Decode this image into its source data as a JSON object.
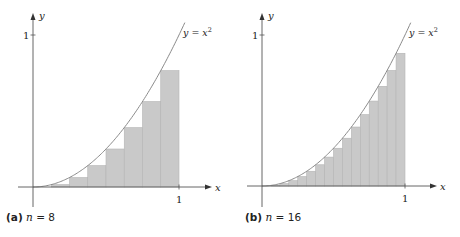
{
  "colors": {
    "fill": "#c9c9c9",
    "rect_edge": "#b4b4b4",
    "curve": "#8a8a8a",
    "axis": "#555555",
    "text": "#222222"
  },
  "panels": [
    {
      "id": "a",
      "caption_tag": "(a)",
      "caption_var": "n",
      "caption_eq": " = 8",
      "n": 8,
      "curve_label": "y = x",
      "curve_label_exp": "2",
      "x_axis_label": "x",
      "y_axis_label": "y",
      "x_tick_label": "1",
      "y_tick_label": "1",
      "geom": {
        "ox": 33,
        "oy": 187,
        "w": 146,
        "h": 152,
        "x_end": 212,
        "y_top": 13,
        "y_bottom": 207,
        "x_start": 18
      }
    },
    {
      "id": "b",
      "caption_tag": "(b)",
      "caption_var": "n",
      "caption_eq": " = 16",
      "n": 16,
      "curve_label": "y = x",
      "curve_label_exp": "2",
      "x_axis_label": "x",
      "y_axis_label": "y",
      "x_tick_label": "1",
      "y_tick_label": "1",
      "geom": {
        "ox": 262,
        "oy": 186,
        "w": 143,
        "h": 151,
        "x_end": 437,
        "y_top": 13,
        "y_bottom": 207,
        "x_start": 247
      }
    }
  ],
  "chart_data": [
    {
      "type": "area",
      "title": "(a) n = 8",
      "function": "y = x^2",
      "method": "left Riemann sum (lower rectangles)",
      "n": 8,
      "x": [
        0,
        0.125,
        0.25,
        0.375,
        0.5,
        0.625,
        0.75,
        0.875
      ],
      "values": [
        0,
        0.015625,
        0.0625,
        0.140625,
        0.25,
        0.390625,
        0.5625,
        0.765625
      ],
      "xlabel": "x",
      "ylabel": "y",
      "xlim": [
        0,
        1
      ],
      "ylim": [
        0,
        1
      ],
      "x_ticks": [
        "1"
      ],
      "y_ticks": [
        "1"
      ],
      "grid": false
    },
    {
      "type": "area",
      "title": "(b) n = 16",
      "function": "y = x^2",
      "method": "left Riemann sum (lower rectangles)",
      "n": 16,
      "x": [
        0,
        0.0625,
        0.125,
        0.1875,
        0.25,
        0.3125,
        0.375,
        0.4375,
        0.5,
        0.5625,
        0.625,
        0.6875,
        0.75,
        0.8125,
        0.875,
        0.9375
      ],
      "values": [
        0,
        0.0039,
        0.0156,
        0.0352,
        0.0625,
        0.0977,
        0.1406,
        0.1914,
        0.25,
        0.3164,
        0.3906,
        0.4727,
        0.5625,
        0.6602,
        0.7656,
        0.8789
      ],
      "xlabel": "x",
      "ylabel": "y",
      "xlim": [
        0,
        1
      ],
      "ylim": [
        0,
        1
      ],
      "x_ticks": [
        "1"
      ],
      "y_ticks": [
        "1"
      ],
      "grid": false
    }
  ]
}
